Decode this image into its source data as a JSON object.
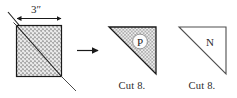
{
  "figure": {
    "kind": "quilting cut diagram"
  },
  "dimension": {
    "label": "3″",
    "value": 3,
    "unit": "inch",
    "arrow_style": "double-headed"
  },
  "shapes": [
    {
      "id": "source-square",
      "role": "source-fabric-square",
      "geometry": "square",
      "fill": "stipple-texture",
      "fill_color": "#b9b9b9",
      "stroke_color": "#1a1a1a",
      "cut_line": "diagonal top-left to bottom-right",
      "label": ""
    },
    {
      "id": "triangle-p",
      "role": "resulting-triangle",
      "geometry": "right-triangle",
      "right_angle_corner": "top-right",
      "fill": "stipple-texture",
      "fill_color": "#b9b9b9",
      "stroke_color": "#1a1a1a",
      "label": "P",
      "cut_note": "Cut 8."
    },
    {
      "id": "triangle-n",
      "role": "resulting-triangle",
      "geometry": "right-triangle",
      "right_angle_corner": "top-right",
      "fill": "none",
      "fill_color": "#ffffff",
      "stroke_color": "#5a5a5a",
      "label": "N",
      "cut_note": "Cut 8."
    }
  ],
  "arrow": {
    "direction": "right",
    "name": "process-arrow"
  },
  "labels": {
    "piece_p": "P",
    "piece_n": "N",
    "cut_p": "Cut 8.",
    "cut_n": "Cut 8."
  },
  "colors": {
    "ink": "#1a1a1a",
    "ink_soft": "#5a5a5a",
    "text": "#2b2b2b",
    "stipple": "#b9b9b9",
    "paper": "#ffffff"
  }
}
